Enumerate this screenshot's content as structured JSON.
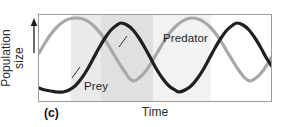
{
  "figure": {
    "panel_letter": "(c)",
    "y_axis_label_line1": "Population",
    "y_axis_label_line2": "size",
    "x_axis_label": "Time",
    "y_axis_arrow": "up-arrow-icon"
  },
  "chart_data": {
    "type": "line",
    "title": "",
    "subtitle": "",
    "xlabel": "Time",
    "ylabel": "Population size",
    "grid": false,
    "legend_position": "inline-annotations",
    "xlim": [
      0,
      234
    ],
    "ylim": [
      0,
      88
    ],
    "axis_ticks": {
      "x": [],
      "y": []
    },
    "annotations": [
      {
        "text": "Predator",
        "x": 124,
        "y": 17,
        "leader_to": [
          118,
          46
        ],
        "series": "Predator"
      },
      {
        "text": "Prey",
        "x": 45,
        "y": 65,
        "leader_to": [
          72,
          56
        ],
        "series": "Prey"
      }
    ],
    "shaded_bands": [
      {
        "x0": 0,
        "x1": 32,
        "color": "#ffffff"
      },
      {
        "x0": 32,
        "x1": 62,
        "color": "#eaeaea"
      },
      {
        "x0": 62,
        "x1": 114,
        "color": "#e0e0e0"
      },
      {
        "x0": 114,
        "x1": 172,
        "color": "#f2f2f2"
      },
      {
        "x0": 172,
        "x1": 234,
        "color": "#ffffff"
      }
    ],
    "series": [
      {
        "name": "Prey",
        "color": "#a8a8a8",
        "linewidth": 3.2,
        "phase_description": "leads predator by about one quarter cycle",
        "period": 116,
        "peaks_x": [
          37,
          153
        ],
        "troughs_x": [
          95,
          211
        ],
        "points": [
          [
            0,
            50
          ],
          [
            6,
            60
          ],
          [
            12,
            69
          ],
          [
            18,
            76
          ],
          [
            24,
            81
          ],
          [
            30,
            84
          ],
          [
            37,
            85
          ],
          [
            44,
            84
          ],
          [
            50,
            81
          ],
          [
            56,
            76
          ],
          [
            62,
            69
          ],
          [
            68,
            60
          ],
          [
            74,
            50
          ],
          [
            80,
            40
          ],
          [
            86,
            31
          ],
          [
            90,
            25
          ],
          [
            95,
            22
          ],
          [
            100,
            25
          ],
          [
            106,
            31
          ],
          [
            112,
            40
          ],
          [
            118,
            50
          ],
          [
            124,
            60
          ],
          [
            130,
            69
          ],
          [
            136,
            76
          ],
          [
            142,
            81
          ],
          [
            148,
            84
          ],
          [
            153,
            85
          ],
          [
            159,
            84
          ],
          [
            165,
            81
          ],
          [
            171,
            76
          ],
          [
            177,
            69
          ],
          [
            183,
            60
          ],
          [
            189,
            50
          ],
          [
            195,
            40
          ],
          [
            201,
            31
          ],
          [
            206,
            25
          ],
          [
            211,
            22
          ],
          [
            217,
            25
          ],
          [
            223,
            31
          ],
          [
            229,
            40
          ],
          [
            234,
            48
          ]
        ]
      },
      {
        "name": "Predator",
        "color": "#1f1f1f",
        "linewidth": 3.2,
        "phase_description": "lags prey by about one quarter cycle",
        "period": 116,
        "peaks_x": [
          82,
          198
        ],
        "troughs_x": [
          24,
          140
        ],
        "points": [
          [
            0,
            15
          ],
          [
            6,
            13
          ],
          [
            12,
            12
          ],
          [
            18,
            11
          ],
          [
            24,
            11
          ],
          [
            30,
            13
          ],
          [
            36,
            17
          ],
          [
            42,
            24
          ],
          [
            48,
            33
          ],
          [
            54,
            44
          ],
          [
            60,
            55
          ],
          [
            66,
            65
          ],
          [
            72,
            73
          ],
          [
            78,
            78
          ],
          [
            82,
            80
          ],
          [
            88,
            78
          ],
          [
            94,
            73
          ],
          [
            100,
            65
          ],
          [
            106,
            55
          ],
          [
            112,
            44
          ],
          [
            118,
            33
          ],
          [
            124,
            24
          ],
          [
            130,
            17
          ],
          [
            136,
            13
          ],
          [
            140,
            11
          ],
          [
            146,
            13
          ],
          [
            152,
            17
          ],
          [
            158,
            24
          ],
          [
            164,
            33
          ],
          [
            170,
            44
          ],
          [
            176,
            55
          ],
          [
            182,
            65
          ],
          [
            188,
            73
          ],
          [
            194,
            78
          ],
          [
            198,
            80
          ],
          [
            204,
            78
          ],
          [
            210,
            73
          ],
          [
            216,
            65
          ],
          [
            222,
            55
          ],
          [
            228,
            44
          ],
          [
            234,
            35
          ]
        ]
      }
    ]
  }
}
